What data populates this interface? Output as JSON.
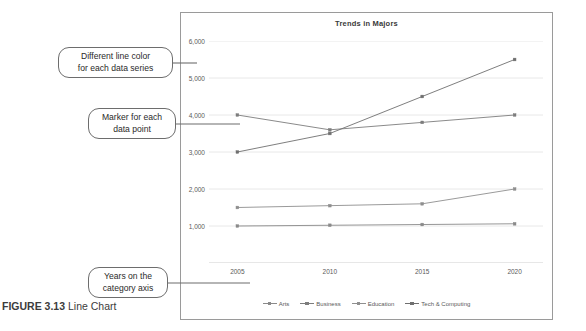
{
  "figure": {
    "label": "FIGURE 3.13",
    "caption": "Line Chart"
  },
  "callouts": [
    {
      "name": "different-line-color",
      "line1": "Different line color",
      "line2": "for each data series"
    },
    {
      "name": "marker-for-each-point",
      "line1": "Marker for each",
      "line2": "data point"
    },
    {
      "name": "years-on-category-axis",
      "line1": "Years on the",
      "line2": "category axis"
    }
  ],
  "colors": {
    "arts": "#8a8a8a",
    "business": "#7d7d7d",
    "education": "#8f8f8f",
    "tech": "#6f6f6f",
    "gridline": "#e2e2e2",
    "axis": "#c9c9c9",
    "border": "#9a9a9a",
    "text": "#5a5a5a"
  },
  "chart_data": {
    "type": "line",
    "title": "Trends in Majors",
    "xlabel": "",
    "ylabel": "",
    "categories": [
      "2005",
      "2010",
      "2015",
      "2020"
    ],
    "ylim": [
      0,
      6000
    ],
    "yticks": [
      1000,
      2000,
      3000,
      4000,
      5000,
      6000
    ],
    "ytick_labels": [
      "1,000",
      "2,000",
      "3,000",
      "4,000",
      "5,000",
      "6,000"
    ],
    "grid": true,
    "markers": true,
    "legend_position": "bottom",
    "series": [
      {
        "name": "Arts",
        "values": [
          1000,
          1020,
          1040,
          1060
        ]
      },
      {
        "name": "Business",
        "values": [
          4000,
          3600,
          3800,
          4000
        ]
      },
      {
        "name": "Education",
        "values": [
          1500,
          1550,
          1600,
          2000
        ]
      },
      {
        "name": "Tech & Computing",
        "values": [
          3000,
          3500,
          4500,
          5500
        ]
      }
    ]
  }
}
